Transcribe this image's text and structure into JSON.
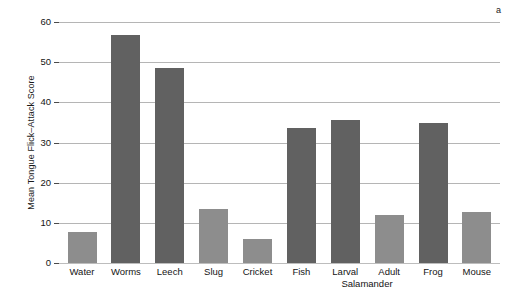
{
  "chart_data": {
    "type": "bar",
    "title": "",
    "panel_label": "a",
    "xlabel": "",
    "ylabel": "Mean Tongue Flick–Attack Score",
    "categories": [
      "Water",
      "Worms",
      "Leech",
      "Slug",
      "Cricket",
      "Fish",
      "Larval",
      "Adult",
      "Frog",
      "Mouse"
    ],
    "values": [
      7.7,
      56.8,
      48.5,
      13.4,
      6.0,
      33.6,
      35.6,
      11.9,
      34.8,
      12.6
    ],
    "bar_shades": [
      "light",
      "dark",
      "dark",
      "light",
      "light",
      "dark",
      "dark",
      "light",
      "dark",
      "light"
    ],
    "group_annotation": "Salamander",
    "group_annotation_members": [
      "Larval",
      "Adult"
    ],
    "ylim": [
      0,
      60
    ],
    "yticks": [
      0,
      10,
      20,
      30,
      40,
      50,
      60
    ],
    "ytick_labels": [
      "0",
      "10",
      "20",
      "30",
      "40",
      "50",
      "60"
    ],
    "grid": true,
    "legend": "none",
    "colors": {
      "bar_dark": "#616161",
      "bar_light": "#8d8d8d",
      "gridline": "#b5b5b5",
      "text": "#141414",
      "background": "#ffffff"
    }
  }
}
